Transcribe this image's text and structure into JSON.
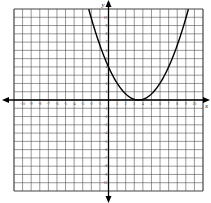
{
  "chart_data": {
    "type": "line",
    "title": "",
    "xlabel": "x",
    "ylabel": "y",
    "xlim": [
      -11,
      11
    ],
    "ylim": [
      -11,
      11
    ],
    "grid": true,
    "x_ticks": [
      -10,
      -9,
      -8,
      -7,
      -6,
      -5,
      -4,
      -3,
      -2,
      -1,
      1,
      2,
      3,
      4,
      5,
      6,
      7,
      8,
      9,
      10
    ],
    "y_ticks": [
      10,
      9,
      8,
      7,
      6,
      5,
      4,
      3,
      2,
      1,
      -1,
      -2,
      -3,
      -4,
      -5,
      -6,
      -7,
      -8,
      -9,
      -10
    ],
    "series": [
      {
        "name": "parabola",
        "equation": "approx y = a(x - 3.5)^2",
        "vertex": [
          3.5,
          0
        ],
        "y_intercept": 4,
        "note": "approximate; observed top-edge exits near x≈-2 (left) and x≈7.5 (right) are not symmetric about the vertex, so a single parabola does not fit all readings exactly"
      }
    ]
  },
  "axes": {
    "x_name": "x",
    "y_name": "y"
  },
  "colors": {
    "grid": "#444444",
    "axis": "#000000",
    "curve": "#000000"
  }
}
